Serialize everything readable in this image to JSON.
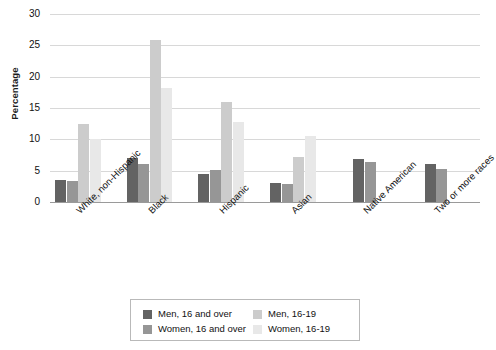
{
  "chart_data": {
    "type": "bar",
    "title": "",
    "subtitle": "",
    "xlabel": "",
    "ylabel": "Percentage",
    "ylim": [
      0,
      30
    ],
    "yticks": [
      0,
      5,
      10,
      15,
      20,
      25,
      30
    ],
    "ytick_labels": [
      "0",
      "5",
      "10",
      "15",
      "20",
      "25",
      "30"
    ],
    "grid": true,
    "legend_position": "bottom",
    "categories": [
      "White, non-Hispanic",
      "Black",
      "Hispanic",
      "Asian",
      "Native American",
      "Two or more races"
    ],
    "series": [
      {
        "name": "Men, 16 and over",
        "color": "#636363",
        "values": [
          3.5,
          7.1,
          4.5,
          3.0,
          6.9,
          6.0
        ]
      },
      {
        "name": "Women, 16 and over",
        "color": "#969696",
        "values": [
          3.3,
          6.0,
          5.1,
          2.9,
          6.4,
          5.3
        ]
      },
      {
        "name": "Men, 16-19",
        "color": "#cccccc",
        "values": [
          12.5,
          25.8,
          16.0,
          7.2,
          null,
          null
        ]
      },
      {
        "name": "Women, 16-19",
        "color": "#e8e8e8",
        "values": [
          10.0,
          18.2,
          12.7,
          10.6,
          null,
          null
        ]
      }
    ]
  },
  "axis": {
    "y_title": "Percentage",
    "y_ticks": [
      "30",
      "25",
      "20",
      "15",
      "10",
      "5",
      "0"
    ],
    "x_ticks": [
      "White, non-Hispanic",
      "Black",
      "Hispanic",
      "Asian",
      "Native American",
      "Two or more races"
    ]
  },
  "legend": {
    "items": [
      {
        "label": "Men, 16 and over",
        "color": "#636363"
      },
      {
        "label": "Men, 16-19",
        "color": "#cccccc"
      },
      {
        "label": "Women, 16 and over",
        "color": "#969696"
      },
      {
        "label": "Women, 16-19",
        "color": "#e8e8e8"
      }
    ]
  }
}
